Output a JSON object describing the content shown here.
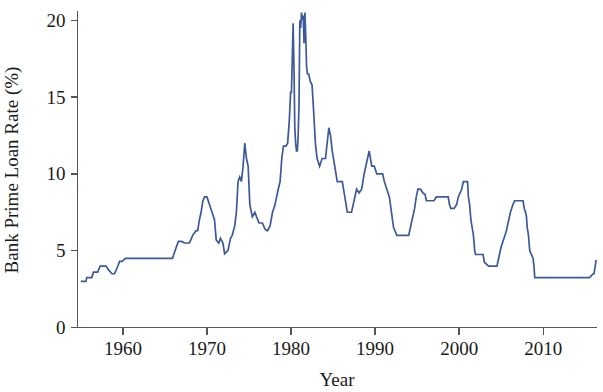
{
  "chart_data": {
    "type": "line",
    "title": "",
    "xlabel": "Year",
    "ylabel": "Bank Prime Loan Rate (%)",
    "xlim": [
      1954.6,
      2016.4
    ],
    "ylim": [
      0,
      20.6
    ],
    "xticks": [
      1960,
      1970,
      1980,
      1990,
      2000,
      2010
    ],
    "xtick_labels": [
      "1960",
      "1970",
      "1980",
      "1990",
      "2000",
      "2010"
    ],
    "yticks": [
      0,
      5,
      10,
      15,
      20
    ],
    "ytick_labels": [
      "0",
      "5",
      "10",
      "15",
      "20"
    ],
    "grid": false,
    "legend": null,
    "line_color": "#3c5a9a",
    "line_width": 1.7,
    "series": [
      {
        "name": "Bank Prime Loan Rate",
        "x": [
          1955.0,
          1955.6,
          1955.7,
          1956.3,
          1956.5,
          1957.0,
          1957.3,
          1957.8,
          1958.0,
          1958.3,
          1958.7,
          1959.0,
          1959.4,
          1959.6,
          1959.9,
          1960.3,
          1960.7,
          1961.0,
          1962.0,
          1963.0,
          1964.0,
          1965.0,
          1965.9,
          1966.2,
          1966.6,
          1967.0,
          1967.3,
          1967.9,
          1968.0,
          1968.3,
          1968.7,
          1968.9,
          1969.1,
          1969.3,
          1969.5,
          1969.7,
          1970.0,
          1970.3,
          1970.6,
          1970.9,
          1971.1,
          1971.4,
          1971.6,
          1971.9,
          1972.1,
          1972.5,
          1972.8,
          1973.0,
          1973.3,
          1973.5,
          1973.7,
          1973.9,
          1974.1,
          1974.3,
          1974.5,
          1974.7,
          1974.9,
          1975.1,
          1975.4,
          1975.7,
          1975.9,
          1976.2,
          1976.6,
          1976.9,
          1977.2,
          1977.5,
          1977.8,
          1978.1,
          1978.4,
          1978.7,
          1978.9,
          1979.1,
          1979.4,
          1979.6,
          1979.8,
          1979.95,
          1980.05,
          1980.15,
          1980.25,
          1980.35,
          1980.45,
          1980.55,
          1980.65,
          1980.75,
          1980.85,
          1980.95,
          1981.05,
          1981.15,
          1981.25,
          1981.35,
          1981.45,
          1981.55,
          1981.65,
          1981.75,
          1981.85,
          1981.95,
          1982.1,
          1982.3,
          1982.5,
          1982.7,
          1982.9,
          1983.1,
          1983.4,
          1983.7,
          1983.9,
          1984.1,
          1984.3,
          1984.5,
          1984.7,
          1984.9,
          1985.2,
          1985.5,
          1985.8,
          1986.1,
          1986.4,
          1986.7,
          1986.9,
          1987.2,
          1987.5,
          1987.8,
          1988.1,
          1988.4,
          1988.7,
          1988.9,
          1989.1,
          1989.3,
          1989.6,
          1989.9,
          1990.2,
          1990.6,
          1990.9,
          1991.1,
          1991.4,
          1991.7,
          1991.95,
          1992.2,
          1992.6,
          1993.0,
          1993.5,
          1994.0,
          1994.3,
          1994.5,
          1994.7,
          1994.9,
          1995.1,
          1995.4,
          1995.7,
          1995.95,
          1996.1,
          1996.5,
          1997.0,
          1997.3,
          1997.6,
          1998.0,
          1998.7,
          1998.85,
          1999.0,
          1999.4,
          1999.7,
          1999.9,
          2000.1,
          2000.3,
          2000.5,
          2000.8,
          2001.0,
          2001.1,
          2001.25,
          2001.4,
          2001.55,
          2001.7,
          2001.85,
          2001.95,
          2002.2,
          2002.85,
          2003.0,
          2003.5,
          2003.7,
          2004.0,
          2004.5,
          2004.6,
          2004.8,
          2005.0,
          2005.3,
          2005.6,
          2005.9,
          2006.1,
          2006.4,
          2006.6,
          2006.9,
          2007.3,
          2007.6,
          2007.75,
          2007.9,
          2008.0,
          2008.1,
          2008.25,
          2008.4,
          2008.8,
          2008.9,
          2009.0,
          2009.3,
          2010.0,
          2011.0,
          2012.0,
          2013.0,
          2014.0,
          2015.0,
          2015.5,
          2015.95,
          2016.05,
          2016.3
        ],
        "y": [
          3.0,
          3.0,
          3.25,
          3.25,
          3.6,
          3.6,
          4.0,
          4.0,
          4.0,
          3.75,
          3.5,
          3.5,
          4.0,
          4.3,
          4.3,
          4.5,
          4.5,
          4.5,
          4.5,
          4.5,
          4.5,
          4.5,
          4.5,
          5.0,
          5.6,
          5.6,
          5.5,
          5.5,
          5.6,
          6.0,
          6.3,
          6.3,
          7.0,
          7.5,
          8.2,
          8.5,
          8.5,
          8.0,
          7.5,
          7.0,
          5.7,
          5.5,
          5.8,
          5.5,
          4.8,
          5.0,
          5.8,
          6.0,
          6.6,
          7.5,
          9.5,
          9.8,
          9.5,
          10.5,
          12.0,
          11.0,
          10.5,
          8.0,
          7.2,
          7.5,
          7.2,
          6.8,
          6.8,
          6.4,
          6.3,
          6.6,
          7.5,
          8.0,
          8.8,
          9.5,
          11.0,
          11.8,
          11.8,
          12.0,
          13.5,
          15.3,
          15.3,
          17.5,
          19.8,
          17.0,
          13.0,
          12.0,
          11.5,
          11.5,
          12.5,
          14.5,
          20.0,
          19.5,
          20.5,
          20.0,
          20.3,
          18.5,
          20.5,
          19.0,
          17.0,
          16.5,
          16.5,
          16.0,
          15.8,
          14.0,
          12.0,
          11.0,
          10.5,
          11.0,
          11.0,
          11.0,
          12.0,
          13.0,
          12.5,
          11.5,
          10.5,
          9.5,
          9.5,
          9.5,
          8.5,
          7.5,
          7.5,
          7.5,
          8.25,
          9.0,
          8.75,
          9.0,
          10.0,
          10.5,
          11.0,
          11.5,
          10.5,
          10.5,
          10.0,
          10.0,
          10.0,
          9.5,
          9.0,
          8.5,
          7.5,
          6.5,
          6.0,
          6.0,
          6.0,
          6.0,
          6.75,
          7.25,
          7.75,
          8.5,
          9.0,
          9.0,
          8.75,
          8.65,
          8.25,
          8.25,
          8.25,
          8.5,
          8.5,
          8.5,
          8.5,
          8.0,
          7.75,
          7.75,
          8.0,
          8.5,
          8.75,
          9.0,
          9.5,
          9.5,
          9.5,
          8.5,
          8.0,
          7.0,
          6.5,
          6.0,
          5.0,
          4.75,
          4.75,
          4.75,
          4.25,
          4.0,
          4.0,
          4.0,
          4.0,
          4.25,
          4.75,
          5.25,
          5.75,
          6.25,
          7.0,
          7.5,
          8.0,
          8.25,
          8.25,
          8.25,
          8.25,
          7.75,
          7.5,
          7.25,
          6.5,
          6.0,
          5.0,
          4.5,
          4.0,
          3.25,
          3.25,
          3.25,
          3.25,
          3.25,
          3.25,
          3.25,
          3.25,
          3.25,
          3.5,
          3.5,
          4.4
        ]
      }
    ]
  },
  "axis": {
    "x_title": "Year",
    "y_title": "Bank Prime Loan Rate (%)"
  }
}
